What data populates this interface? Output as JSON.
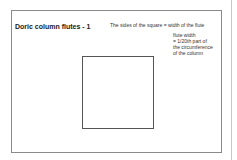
{
  "slide": {
    "title": "Doric column flutes - 1",
    "caption": "The  sides of the square = width of the flute",
    "note_lines": [
      "flute width",
      "= 1/20th part of",
      "the circumference",
      "of the column"
    ]
  }
}
